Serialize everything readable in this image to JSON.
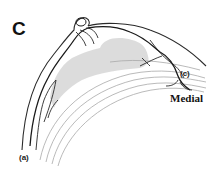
{
  "figure": {
    "panel_letter": "C",
    "labels": {
      "a": "(a)",
      "c": "(c)",
      "medial": "Medial"
    },
    "colors": {
      "background": "#ffffff",
      "ink": "#1a1a1a",
      "shading": "#d4d4d4",
      "thin_lines": "#a8a8a8"
    }
  }
}
